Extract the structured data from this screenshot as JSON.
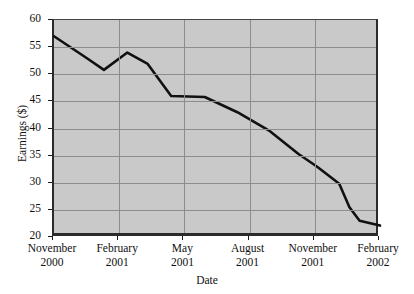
{
  "chart_data": {
    "type": "line",
    "title": "",
    "xlabel": "Date",
    "ylabel": "Earnings ($)",
    "ylim": [
      20,
      60
    ],
    "yticks": [
      20,
      25,
      30,
      35,
      40,
      45,
      50,
      55,
      60
    ],
    "ytick_labels": [
      "20",
      "25",
      "30",
      "35",
      "40",
      "45",
      "50",
      "55",
      "60"
    ],
    "grid": true,
    "legend": "none",
    "plot_background": "#c9c9c9",
    "line_color": "#111111",
    "xtick_labels": [
      {
        "month": "November",
        "year": "2000"
      },
      {
        "month": "February",
        "year": "2001"
      },
      {
        "month": "May",
        "year": "2001"
      },
      {
        "month": "August",
        "year": "2001"
      },
      {
        "month": "November",
        "year": "2001"
      },
      {
        "month": "February",
        "year": "2002"
      }
    ],
    "x": [
      0,
      1,
      2,
      3,
      4,
      5,
      6,
      7,
      8,
      9,
      10,
      11,
      12,
      13,
      14,
      15
    ],
    "values": [
      57.0,
      54.5,
      53.0,
      51.8,
      50.8,
      52.3,
      54.0,
      52.0,
      49.0,
      46.0,
      45.9,
      44.5,
      40.0,
      35.0,
      30.0,
      22.8
    ],
    "series": [
      {
        "name": "Earnings",
        "points": [
          {
            "x": 0.0,
            "y": 57.0
          },
          {
            "x": 1.6,
            "y": 53.0
          },
          {
            "x": 2.45,
            "y": 50.8
          },
          {
            "x": 3.6,
            "y": 54.0
          },
          {
            "x": 4.6,
            "y": 51.9
          },
          {
            "x": 5.75,
            "y": 46.0
          },
          {
            "x": 7.4,
            "y": 45.8
          },
          {
            "x": 9.0,
            "y": 43.0
          },
          {
            "x": 10.6,
            "y": 39.5
          },
          {
            "x": 12.0,
            "y": 35.3
          },
          {
            "x": 12.9,
            "y": 33.0
          },
          {
            "x": 14.0,
            "y": 29.8
          },
          {
            "x": 14.5,
            "y": 25.5
          },
          {
            "x": 15.0,
            "y": 23.0
          },
          {
            "x": 16.0,
            "y": 22.1
          }
        ]
      }
    ]
  }
}
